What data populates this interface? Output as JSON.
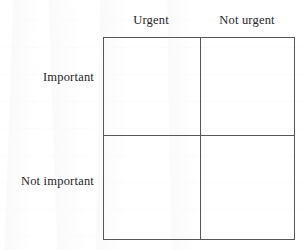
{
  "figure": {
    "name": "eisenhower-matrix",
    "columns": [
      {
        "id": "urgent",
        "label": "Urgent"
      },
      {
        "id": "not-urgent",
        "label": "Not urgent"
      }
    ],
    "rows": [
      {
        "id": "important",
        "label": "Important"
      },
      {
        "id": "not-important",
        "label": "Not important"
      }
    ],
    "cells": [
      {
        "id": "important-urgent",
        "row": "important",
        "column": "urgent",
        "text": ""
      },
      {
        "id": "important-not-urgent",
        "row": "important",
        "column": "not-urgent",
        "text": ""
      },
      {
        "id": "not-important-urgent",
        "row": "not-important",
        "column": "urgent",
        "text": ""
      },
      {
        "id": "not-important-not-urgent",
        "row": "not-important",
        "column": "not-urgent",
        "text": ""
      }
    ],
    "colors": {
      "line": "#57575a",
      "text": "#26262a",
      "background": "#ffffff"
    }
  }
}
